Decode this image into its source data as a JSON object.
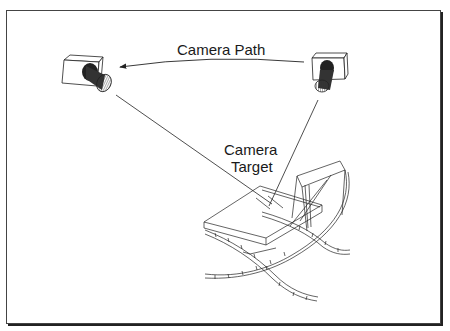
{
  "diagram": {
    "labels": {
      "camera_path": "Camera Path",
      "camera_target_line1": "Camera",
      "camera_target_line2": "Target"
    },
    "elements": [
      {
        "id": "camera-start",
        "type": "camera",
        "position": "upper-left"
      },
      {
        "id": "camera-end",
        "type": "camera",
        "position": "upper-right"
      },
      {
        "id": "camera-path-arc",
        "type": "curved-arrow",
        "from": "camera-end",
        "to": "camera-start"
      },
      {
        "id": "target-object",
        "type": "wireframe-chair",
        "position": "lower-right"
      }
    ],
    "colors": {
      "line": "#222222",
      "frame": "#444444",
      "background": "#ffffff"
    }
  }
}
